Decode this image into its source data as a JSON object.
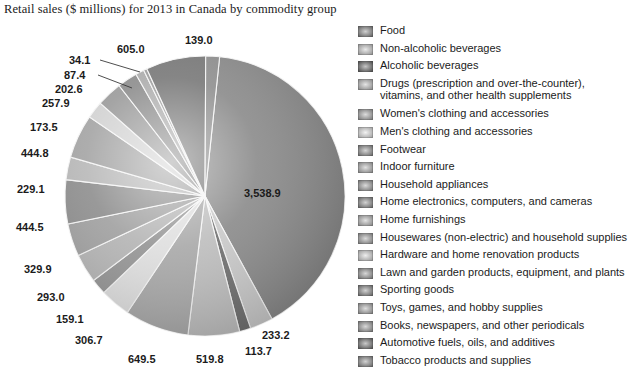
{
  "title": "Retail sales ($ millions) for 2013 in Canada by commodity group",
  "chart_data": {
    "type": "pie",
    "title": "Retail sales ($ millions) for 2013 in Canada by commodity group",
    "unit": "$ millions",
    "year": "2013",
    "region": "Canada",
    "legend_position": "right",
    "grid": false,
    "categories": [
      "Food",
      "Non-alcoholic beverages",
      "Alcoholic beverages",
      "Drugs (prescription and over-the-counter), vitamins, and other health supplements",
      "Women's clothing and accessories",
      "Men's clothing and accessories",
      "Footwear",
      "Indoor furniture",
      "Household appliances",
      "Home electronics, computers, and cameras",
      "Home furnishings",
      "Housewares (non-electric) and household supplies",
      "Hardware and home renovation products",
      "Lawn and garden products, equipment, and plants",
      "Sporting goods",
      "Toys, games, and hobby supplies",
      "Books, newspapers, and other periodicals",
      "Automotive fuels, oils, and additives",
      "Tobacco products and supplies"
    ],
    "values": [
      3538.9,
      233.2,
      113.7,
      519.8,
      649.5,
      306.7,
      159.1,
      293.0,
      329.9,
      444.5,
      229.1,
      444.8,
      173.5,
      257.9,
      202.6,
      87.4,
      34.1,
      605.0,
      139.0
    ],
    "value_labels": [
      "3,538.9",
      "233.2",
      "113.7",
      "519.8",
      "649.5",
      "306.7",
      "159.1",
      "293.0",
      "329.9",
      "444.5",
      "229.1",
      "444.8",
      "173.5",
      "257.9",
      "202.6",
      "87.4",
      "34.1",
      "605.0",
      "139.0"
    ]
  },
  "legend": {
    "items": [
      {
        "label": "Food",
        "color": "#8a8a8a"
      },
      {
        "label": "Non-alcoholic beverages",
        "color": "#c9c9c9"
      },
      {
        "label": "Alcoholic beverages",
        "color": "#6f6f6f"
      },
      {
        "label": "Drugs (prescription and over-the-counter), vitamins, and other health supplements",
        "color": "#bdbdbd"
      },
      {
        "label": "Women's clothing and accessories",
        "color": "#a8a8a8"
      },
      {
        "label": "Men's clothing and accessories",
        "color": "#dedede"
      },
      {
        "label": "Footwear",
        "color": "#949494"
      },
      {
        "label": "Indoor furniture",
        "color": "#b4b4b4"
      },
      {
        "label": "Household appliances",
        "color": "#a0a0a0"
      },
      {
        "label": "Home electronics, computers, and cameras",
        "color": "#8e8e8e"
      },
      {
        "label": "Home furnishings",
        "color": "#b8b8b8"
      },
      {
        "label": "Housewares (non-electric) and household supplies",
        "color": "#a4a4a4"
      },
      {
        "label": "Hardware and home renovation products",
        "color": "#d2d2d2"
      },
      {
        "label": "Lawn and garden products, equipment, and plants",
        "color": "#9a9a9a"
      },
      {
        "label": "Sporting goods",
        "color": "#8c8c8c"
      },
      {
        "label": "Toys, games, and hobby supplies",
        "color": "#acacac"
      },
      {
        "label": "Books, newspapers, and other periodicals",
        "color": "#9e9e9e"
      },
      {
        "label": "Automotive fuels, oils, and additives",
        "color": "#787878"
      },
      {
        "label": "Tobacco products and supplies",
        "color": "#8f8f8f"
      }
    ]
  },
  "pie_labels": [
    {
      "text": "139.0",
      "x": 185,
      "y": 14
    },
    {
      "text": "605.0",
      "x": 117,
      "y": 23
    },
    {
      "text": "34.1",
      "x": 69,
      "y": 34
    },
    {
      "text": "87.4",
      "x": 64,
      "y": 49
    },
    {
      "text": "202.6",
      "x": 55,
      "y": 63
    },
    {
      "text": "257.9",
      "x": 42,
      "y": 77
    },
    {
      "text": "173.5",
      "x": 30,
      "y": 101
    },
    {
      "text": "444.8",
      "x": 21,
      "y": 127
    },
    {
      "text": "229.1",
      "x": 17,
      "y": 163
    },
    {
      "text": "444.5",
      "x": 16,
      "y": 201
    },
    {
      "text": "329.9",
      "x": 24,
      "y": 243
    },
    {
      "text": "293.0",
      "x": 37,
      "y": 271
    },
    {
      "text": "159.1",
      "x": 56,
      "y": 293
    },
    {
      "text": "306.7",
      "x": 75,
      "y": 314
    },
    {
      "text": "649.5",
      "x": 128,
      "y": 333
    },
    {
      "text": "519.8",
      "x": 196,
      "y": 333
    },
    {
      "text": "113.7",
      "x": 245,
      "y": 325
    },
    {
      "text": "233.2",
      "x": 262,
      "y": 309
    },
    {
      "text": "3,538.9",
      "x": 244,
      "y": 167
    }
  ]
}
